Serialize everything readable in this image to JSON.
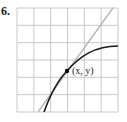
{
  "problem_number": "6.",
  "figure": {
    "grid": {
      "columns": 6,
      "rows": 6
    },
    "point_label": "(x, y)",
    "colors": {
      "grid": "#c8c8c8",
      "curve": "#1a1a1a",
      "tangent": "#b4b4b4",
      "point": "#000000"
    }
  }
}
